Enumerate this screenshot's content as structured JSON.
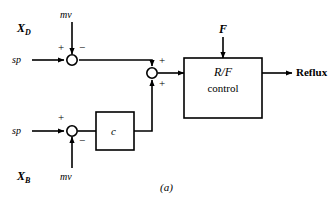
{
  "figure": {
    "caption": "(a)",
    "type": "control-block-diagram"
  },
  "inputs": {
    "xd_label": "X",
    "xd_sub": "D",
    "xb_label": "X",
    "xb_sub": "B",
    "mv_top": "mv",
    "mv_bottom": "mv",
    "sp_top": "sp",
    "sp_bottom": "sp",
    "feed": "F"
  },
  "blocks": {
    "controller_c": "c",
    "rf_line1": "R/F",
    "rf_line2": "control"
  },
  "outputs": {
    "reflux": "Reflux"
  },
  "signs": {
    "top_junction_plus": "+",
    "top_junction_minus": "−",
    "mid_junction_plus_upper": "+",
    "mid_junction_plus_lower": "+",
    "bottom_junction_plus": "+",
    "bottom_junction_minus": "−"
  },
  "colors": {
    "line": "#000000",
    "background": "#ffffff",
    "node_fill": "#ffffff"
  }
}
